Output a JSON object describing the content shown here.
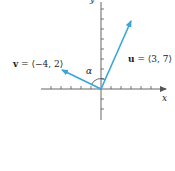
{
  "diagram": {
    "type": "vector-angle",
    "axes": {
      "x_label": "x",
      "y_label": "y"
    },
    "vectors": [
      {
        "name": "u",
        "label_bold": "u",
        "label_rest": " = ⟨3, 7⟩",
        "components": [
          3,
          7
        ],
        "color": "#3aa6d8"
      },
      {
        "name": "v",
        "label_bold": "v",
        "label_rest": " = ⟨−4, 2⟩",
        "components": [
          -4,
          2
        ],
        "color": "#3aa6d8"
      }
    ],
    "angle_label": "α",
    "colors": {
      "axis": "#555555",
      "vector": "#3aa6d8",
      "text": "#222222"
    }
  }
}
